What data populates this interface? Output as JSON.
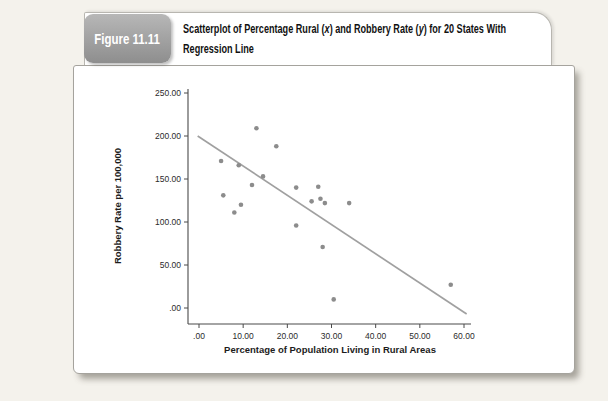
{
  "figure": {
    "label": "Figure 11.11",
    "badge_color": "#9a9a9a",
    "title_line1_parts": [
      {
        "text": "Scatterplot of Percentage Rural ("
      },
      {
        "text": "x",
        "italic": true
      },
      {
        "text": ") and Robbery Rate ("
      },
      {
        "text": "y",
        "italic": true
      },
      {
        "text": ") for 20 States With"
      }
    ],
    "title_line2": "Regression Line"
  },
  "chart_data": {
    "type": "scatter",
    "title": "Scatterplot of Percentage Rural (x) and Robbery Rate (y) for 20 States With Regression Line",
    "xlabel": "Percentage of Population Living in Rural Areas",
    "ylabel": "Robbery Rate per 100,000",
    "xlim": [
      0,
      60
    ],
    "ylim": [
      0,
      250
    ],
    "grid": false,
    "legend": false,
    "x_ticks": [
      0,
      10,
      20,
      30,
      40,
      50,
      60
    ],
    "x_tick_labels": [
      ".00",
      "10.00",
      "20.00",
      "30.00",
      "40.00",
      "50.00",
      "60.00"
    ],
    "y_ticks": [
      0,
      50,
      100,
      150,
      200,
      250
    ],
    "y_tick_labels": [
      ".00",
      "50.00",
      "100.00",
      "150.00",
      "200.00",
      "250.00"
    ],
    "points": [
      [
        13,
        209
      ],
      [
        17.5,
        188
      ],
      [
        5,
        171
      ],
      [
        9,
        166
      ],
      [
        14.5,
        153
      ],
      [
        12,
        143
      ],
      [
        5.5,
        131
      ],
      [
        9.5,
        120
      ],
      [
        8,
        111
      ],
      [
        22,
        140
      ],
      [
        27,
        141
      ],
      [
        25.5,
        124
      ],
      [
        27.5,
        127
      ],
      [
        28.5,
        122
      ],
      [
        34,
        122
      ],
      [
        22,
        96
      ],
      [
        28,
        71
      ],
      [
        30.5,
        10
      ],
      [
        57,
        27
      ]
    ],
    "regression_line": {
      "x1": -0.3,
      "y1": 200,
      "x2": 60.6,
      "y2": -7
    },
    "point_color": "#8c8c8c",
    "line_color": "#a0a0a0",
    "axis_color": "#4a4a4a",
    "text_color": "#2b2b2b"
  }
}
